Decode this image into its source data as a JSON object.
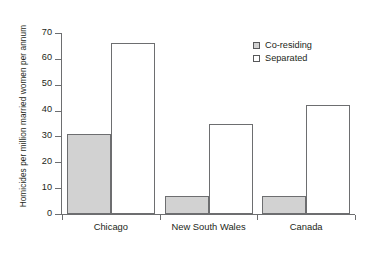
{
  "chart_data": {
    "type": "bar",
    "title": "",
    "xlabel": "",
    "ylabel": "Homicides per million married women per annum",
    "categories": [
      "Chicago",
      "New South Wales",
      "Canada"
    ],
    "series": [
      {
        "name": "Co-residing",
        "color": "#d2d2d2",
        "values": [
          31,
          7,
          7
        ]
      },
      {
        "name": "Separated",
        "color": "#ffffff",
        "values": [
          66,
          35,
          42
        ]
      }
    ],
    "ylim": [
      0,
      70
    ],
    "yticks": [
      0,
      10,
      20,
      30,
      40,
      50,
      60,
      70
    ],
    "ytick_labels": [
      "0",
      "10",
      "20",
      "30",
      "40",
      "50",
      "60",
      "70"
    ],
    "grid": false,
    "legend_position": "top-right",
    "legend": [
      "Co-residing",
      "Separated"
    ]
  }
}
